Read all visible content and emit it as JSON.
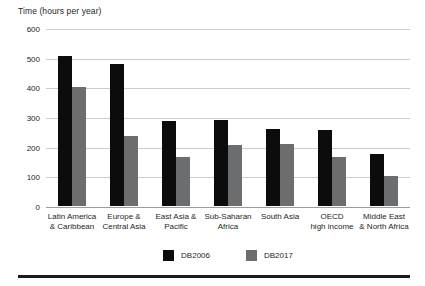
{
  "chart_data": {
    "type": "bar",
    "title": "Time (hours per year)",
    "categories": [
      "Latin America\n& Caribbean",
      "Europe &\nCentral Asia",
      "East Asia &\nPacific",
      "Sub-Saharan\nAfrica",
      "South Asia",
      "OECD\nhigh income",
      "Middle East\n& North Africa"
    ],
    "series": [
      {
        "name": "DB2006",
        "color": "#0c0c0c",
        "values": [
          505,
          480,
          285,
          290,
          260,
          255,
          175
        ]
      },
      {
        "name": "DB2017",
        "color": "#6c6d6f",
        "values": [
          400,
          235,
          165,
          205,
          210,
          165,
          100
        ]
      }
    ],
    "xlabel": "",
    "ylabel": "Time (hours per year)",
    "ylim": [
      0,
      600
    ],
    "yticks": [
      600,
      500,
      400,
      300,
      200,
      100,
      0
    ],
    "grid": "horizontal",
    "legend_position": "bottom-center"
  },
  "legend": {
    "items": [
      {
        "label": "DB2006",
        "color": "#0c0c0c"
      },
      {
        "label": "DB2017",
        "color": "#6c6d6f"
      }
    ]
  },
  "colors": {
    "bar_db2006": "#0c0c0c",
    "bar_db2017": "#6c6d6f",
    "gridline": "#cdcdcd",
    "baseline": "#9b9b9b",
    "text": "#262626",
    "bottom_rule": "#1a1a1a",
    "background": "#ffffff"
  }
}
